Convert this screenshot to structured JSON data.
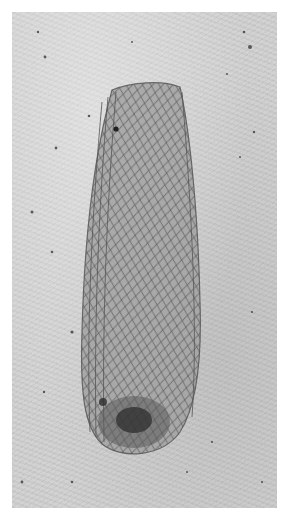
{
  "image": {
    "description": "Grayscale photograph of a fossil insect forewing (elongate, with dense reticulate/crossvein venation) preserved on a pale limestone slab",
    "subject": "fossil insect wing",
    "background": "pale grey speckled stone matrix",
    "colors": {
      "border": "#ffffff",
      "matrix": "#cfcfcf",
      "wing_fill": "#9a9a9a",
      "venation": "#4a4a4a",
      "dark_spot": "#2e2e2e"
    }
  }
}
